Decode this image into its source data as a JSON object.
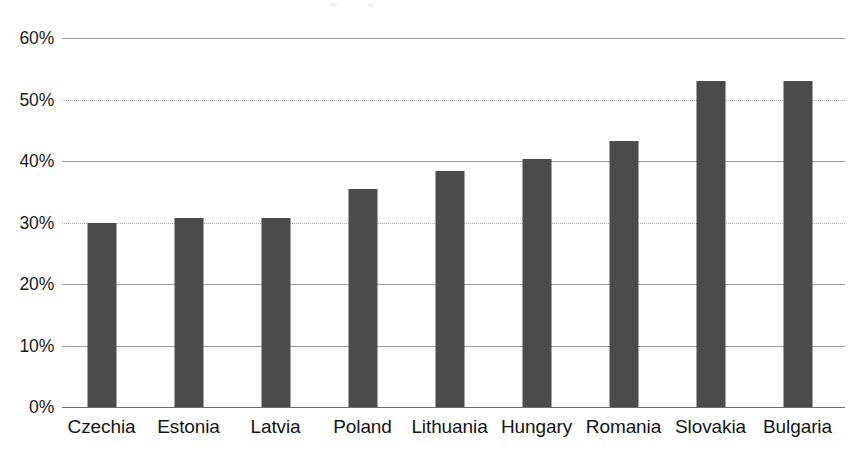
{
  "chart_data": {
    "type": "bar",
    "title": "",
    "subtitle": "",
    "xlabel": "",
    "ylabel": "",
    "categories": [
      "Czechia",
      "Estonia",
      "Latvia",
      "Poland",
      "Lithuania",
      "Hungary",
      "Romania",
      "Slovakia",
      "Bulgaria"
    ],
    "values": [
      29.9,
      30.8,
      30.7,
      35.4,
      38.3,
      40.3,
      43.2,
      53.0,
      53.0
    ],
    "value_labels": [
      "29.9%",
      "30.8%",
      "30.7%",
      "35.4%",
      "38.3%",
      "40.3%",
      "43.2%",
      "53.0%",
      "53.0%"
    ],
    "ylim": [
      0,
      60
    ],
    "y_ticks": [
      0,
      10,
      20,
      30,
      40,
      50,
      60
    ],
    "y_tick_labels": [
      "0%",
      "10%",
      "20%",
      "30%",
      "40%",
      "50%",
      "60%"
    ],
    "grid": true,
    "grid_axis": "y",
    "legend": null,
    "legend_position": "none",
    "series": [
      {
        "name": "",
        "values": [
          29.9,
          30.8,
          30.7,
          35.4,
          38.3,
          40.3,
          43.2,
          53.0,
          53.0
        ]
      }
    ],
    "bar_color": "#4b4b4b",
    "gridline_color": "#9a9a9a",
    "axis_color": "#6e6e6e",
    "text_color": "#141414"
  }
}
